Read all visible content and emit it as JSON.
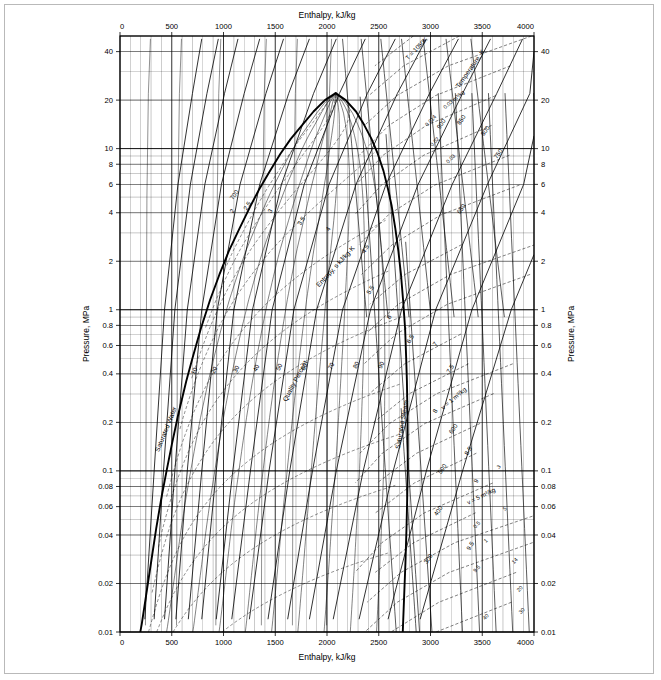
{
  "figure": {
    "kind": "thermodynamic-property-chart",
    "substance": "water",
    "caption": ""
  },
  "chart_data": {
    "type": "line",
    "title": "",
    "subtitle": "",
    "xlabel": "Enthalpy, kJ/kg",
    "ylabel": "Pressure, MPa",
    "xlabel_top": "Enthalpy, kJ/kg",
    "ylabel_right": "Pressure, MPa",
    "xscale": "linear",
    "yscale": "log",
    "xlim": [
      0,
      4000
    ],
    "ylim": [
      0.01,
      50
    ],
    "grid": true,
    "legend": "none",
    "x_ticks": [
      0,
      500,
      1000,
      1500,
      2000,
      2500,
      3000,
      3500,
      4000
    ],
    "x_tick_labels": [
      "0",
      "500",
      "1000",
      "1500",
      "2000",
      "2500",
      "3000",
      "3500",
      "4000"
    ],
    "x_minor_step": 100,
    "y_ticks": [
      0.01,
      0.02,
      0.04,
      0.06,
      0.08,
      0.1,
      0.2,
      0.4,
      0.6,
      0.8,
      1,
      2,
      4,
      6,
      8,
      10,
      20,
      40
    ],
    "y_tick_labels": [
      "0.01",
      "0.02",
      "0.04",
      "0.06",
      "0.08",
      "0.1",
      "0.2",
      "0.4",
      "0.6",
      "0.8",
      "1",
      "2",
      "4",
      "6",
      "8",
      "10",
      "20",
      "40"
    ],
    "series": [
      {
        "name": "saturated-water-line",
        "label": "Saturated Water",
        "style": "heavy",
        "points": [
          [
            2084,
            22.1
          ],
          [
            1980,
            20
          ],
          [
            1870,
            17
          ],
          [
            1760,
            14
          ],
          [
            1650,
            11.5
          ],
          [
            1550,
            9.3
          ],
          [
            1450,
            7.3
          ],
          [
            1345,
            5.6
          ],
          [
            1260,
            4.4
          ],
          [
            1155,
            3.2
          ],
          [
            1050,
            2.3
          ],
          [
            960,
            1.65
          ],
          [
            870,
            1.15
          ],
          [
            780,
            0.76
          ],
          [
            700,
            0.5
          ],
          [
            640,
            0.36
          ],
          [
            560,
            0.22
          ],
          [
            500,
            0.145
          ],
          [
            450,
            0.1
          ],
          [
            400,
            0.068
          ],
          [
            350,
            0.044
          ],
          [
            300,
            0.027
          ],
          [
            250,
            0.0165
          ],
          [
            210,
            0.0112
          ],
          [
            190,
            0.0095
          ],
          [
            180,
            0.0085
          ]
        ]
      },
      {
        "name": "saturated-steam-line",
        "label": "Saturated Steam",
        "style": "heavy",
        "points": [
          [
            2084,
            22.1
          ],
          [
            2180,
            20
          ],
          [
            2280,
            17
          ],
          [
            2360,
            14
          ],
          [
            2430,
            11.5
          ],
          [
            2490,
            9.3
          ],
          [
            2545,
            7.3
          ],
          [
            2590,
            5.6
          ],
          [
            2625,
            4.4
          ],
          [
            2660,
            3.2
          ],
          [
            2690,
            2.3
          ],
          [
            2715,
            1.65
          ],
          [
            2735,
            1.15
          ],
          [
            2755,
            0.76
          ],
          [
            2765,
            0.5
          ],
          [
            2772,
            0.36
          ],
          [
            2778,
            0.22
          ],
          [
            2780,
            0.145
          ],
          [
            2780,
            0.1
          ],
          [
            2775,
            0.068
          ],
          [
            2768,
            0.044
          ],
          [
            2758,
            0.027
          ],
          [
            2745,
            0.0165
          ],
          [
            2735,
            0.0112
          ],
          [
            2728,
            0.0085
          ]
        ]
      }
    ],
    "quality_lines": {
      "label": "Quality Percent",
      "unit": "%",
      "values": [
        10,
        20,
        30,
        40,
        50,
        60,
        70,
        80,
        90
      ],
      "style": "thin"
    },
    "entropy_lines": {
      "label": "Entropy, s kJ/kg·K",
      "unit": "kJ/kg·K",
      "values": [
        2,
        2.5,
        3,
        3.5,
        4,
        4.5,
        5,
        5.5,
        6,
        6.5,
        7,
        7.5,
        8,
        8.5,
        9,
        9.5
      ],
      "style": "medium"
    },
    "temperature_lines": {
      "label": "Temperature, K",
      "unit": "K",
      "values": [
        300,
        400,
        500,
        600,
        650,
        700,
        750,
        800,
        850,
        900,
        1000,
        1050
      ],
      "top_label": "T = 1050K",
      "style": "thin-solid"
    },
    "specific_volume_lines": {
      "label": "v = 1 m³/kg",
      "label_alt": "v = 5 m³/kg",
      "label_small": "0.03 m³/kg",
      "unit": "m³/kg",
      "values": [
        0.001,
        0.002,
        0.003,
        0.005,
        0.007,
        0.01,
        0.014,
        0.02,
        0.03,
        0.05,
        0.08,
        0.14,
        0.2,
        0.3,
        0.5,
        0.8,
        1,
        1.4,
        2,
        3,
        5,
        7,
        9.5,
        14,
        20,
        30,
        40
      ],
      "style": "dashed"
    }
  },
  "annotations": {
    "saturated_water": "Saturated Water",
    "saturated_steam": "Saturated Steam",
    "quality_percent": "Quality Percent",
    "entropy": "Entropy, s kJ/kg·K",
    "temperature": "Temperature, K",
    "t_top": "T = 1050K",
    "v_one": "v = 1 m³/kg",
    "v_five": "v = 5 m³/kg",
    "v_small": "0.03 m³/kg"
  }
}
